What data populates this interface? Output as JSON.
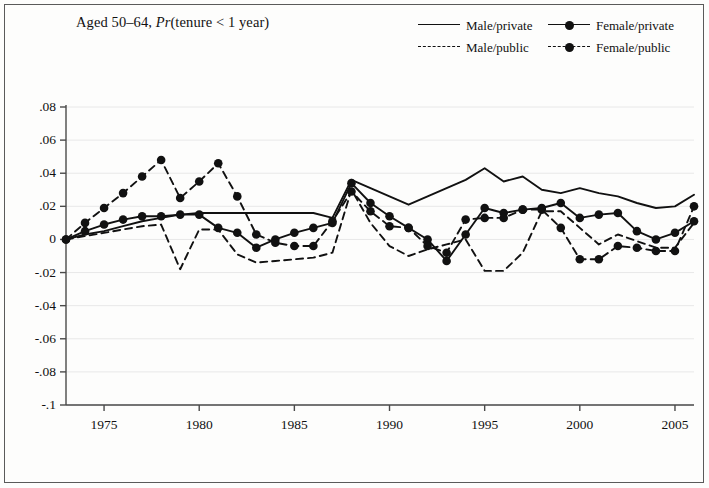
{
  "figure": {
    "title_plain": "Aged 50–64, ",
    "title_italic": "Pr",
    "title_rest": "(tenure < 1 year)"
  },
  "legend": {
    "position": "top-right",
    "entries": [
      {
        "label": "Male/private",
        "style": "solid",
        "marker": false
      },
      {
        "label": "Female/private",
        "style": "solid",
        "marker": true
      },
      {
        "label": "Male/public",
        "style": "dashed",
        "marker": false
      },
      {
        "label": "Female/public",
        "style": "dashed",
        "marker": true
      }
    ]
  },
  "chart_data": {
    "type": "line",
    "title": "Aged 50–64, Pr(tenure < 1 year)",
    "xlabel": "",
    "ylabel": "",
    "xlim": [
      1973,
      2006
    ],
    "ylim": [
      -0.1,
      0.08
    ],
    "grid": true,
    "grid_axis": "y",
    "xticks": [
      1975,
      1980,
      1985,
      1990,
      1995,
      2000,
      2005
    ],
    "xticklabels": [
      "1975",
      "1980",
      "1985",
      "1990",
      "1995",
      "2000",
      "2005"
    ],
    "yticks": [
      0.08,
      0.06,
      0.04,
      0.02,
      0,
      -0.02,
      -0.04,
      -0.06,
      -0.08,
      -0.1
    ],
    "yticklabels": [
      ".08",
      ".06",
      ".04",
      ".02",
      "0",
      "-.02",
      "-.04",
      "-.06",
      "-.08",
      "-.1"
    ],
    "x": [
      1973,
      1974,
      1975,
      1976,
      1977,
      1978,
      1979,
      1980,
      1981,
      1982,
      1983,
      1984,
      1985,
      1986,
      1987,
      1988,
      1989,
      1990,
      1991,
      1992,
      1993,
      1994,
      1995,
      1996,
      1997,
      1998,
      1999,
      2000,
      2001,
      2002,
      2003,
      2004,
      2005,
      2006
    ],
    "series": [
      {
        "name": "Male/private",
        "style": "solid",
        "marker": false,
        "color": "#111111",
        "values": [
          0.0,
          0.003,
          0.005,
          0.008,
          0.011,
          0.013,
          0.015,
          0.016,
          0.016,
          0.016,
          0.016,
          0.016,
          0.016,
          0.016,
          0.013,
          0.036,
          0.031,
          0.026,
          0.021,
          0.026,
          0.031,
          0.036,
          0.043,
          0.035,
          0.038,
          0.03,
          0.028,
          0.031,
          0.028,
          0.026,
          0.022,
          0.019,
          0.02,
          0.027
        ]
      },
      {
        "name": "Female/private",
        "style": "solid",
        "marker": true,
        "color": "#111111",
        "values": [
          0.0,
          0.005,
          0.009,
          0.012,
          0.014,
          0.014,
          0.015,
          0.015,
          0.007,
          0.004,
          -0.005,
          0.0,
          0.004,
          0.007,
          0.01,
          0.034,
          0.022,
          0.014,
          0.007,
          0.0,
          -0.013,
          0.003,
          0.019,
          0.016,
          0.018,
          0.019,
          0.022,
          0.013,
          0.015,
          0.016,
          0.005,
          0.0,
          0.004,
          0.011
        ]
      },
      {
        "name": "Male/public",
        "style": "dashed",
        "marker": false,
        "color": "#111111",
        "values": [
          0.0,
          0.002,
          0.004,
          0.006,
          0.008,
          0.009,
          -0.018,
          0.006,
          0.006,
          -0.009,
          -0.014,
          -0.013,
          -0.012,
          -0.011,
          -0.008,
          0.03,
          0.01,
          -0.004,
          -0.01,
          -0.006,
          -0.003,
          0.0,
          -0.019,
          -0.019,
          -0.008,
          0.017,
          0.017,
          0.007,
          -0.003,
          0.003,
          -0.001,
          -0.005,
          -0.005,
          0.01
        ]
      },
      {
        "name": "Female/public",
        "style": "dashed",
        "marker": true,
        "color": "#111111",
        "values": [
          0.0,
          0.01,
          0.019,
          0.028,
          0.038,
          0.048,
          0.025,
          0.035,
          0.046,
          0.026,
          0.003,
          -0.002,
          -0.004,
          -0.004,
          0.011,
          0.029,
          0.017,
          0.008,
          0.007,
          -0.004,
          -0.008,
          0.012,
          0.013,
          0.013,
          0.018,
          0.018,
          0.007,
          -0.012,
          -0.012,
          -0.004,
          -0.005,
          -0.007,
          -0.007,
          0.02
        ]
      }
    ]
  }
}
